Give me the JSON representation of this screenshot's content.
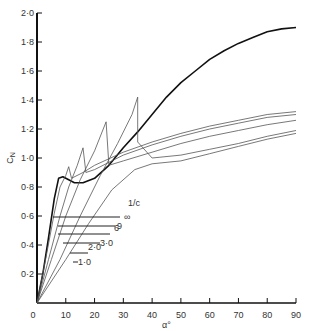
{
  "chart_data": {
    "type": "line",
    "title": "",
    "xlabel": "α°",
    "ylabel": "C_N",
    "xlim": [
      0,
      90
    ],
    "ylim": [
      0,
      2.0
    ],
    "grid": false,
    "x_ticks": [
      0,
      10,
      20,
      30,
      40,
      50,
      60,
      70,
      80,
      90
    ],
    "x_tick_labels": [
      "0",
      "10",
      "20",
      "30",
      "40",
      "50",
      "60",
      "70",
      "80",
      "90"
    ],
    "y_ticks": [
      0.2,
      0.4,
      0.6,
      0.8,
      1.0,
      1.2,
      1.4,
      1.6,
      1.8,
      2.0
    ],
    "y_tick_labels": [
      "0·2",
      "0·4",
      "0·6",
      "0·8",
      "1·0",
      "1·2",
      "1·4",
      "1·6",
      "1·8",
      "2·0"
    ],
    "legend": {
      "title": "1/c",
      "position": "inside-left-middle",
      "entries": [
        "∞",
        "9",
        "6",
        "3·0",
        "2·0",
        "1·0"
      ]
    },
    "series": [
      {
        "name": "∞",
        "bold": true,
        "points": [
          [
            0,
            0
          ],
          [
            2,
            0.2
          ],
          [
            4,
            0.45
          ],
          [
            6,
            0.72
          ],
          [
            7.5,
            0.86
          ],
          [
            9,
            0.87
          ],
          [
            11,
            0.85
          ],
          [
            13,
            0.83
          ],
          [
            16,
            0.83
          ],
          [
            20,
            0.86
          ],
          [
            25,
            0.95
          ],
          [
            30,
            1.07
          ],
          [
            35,
            1.18
          ],
          [
            40,
            1.3
          ],
          [
            45,
            1.42
          ],
          [
            50,
            1.52
          ],
          [
            55,
            1.6
          ],
          [
            60,
            1.68
          ],
          [
            65,
            1.74
          ],
          [
            70,
            1.79
          ],
          [
            75,
            1.83
          ],
          [
            80,
            1.87
          ],
          [
            85,
            1.89
          ],
          [
            90,
            1.9
          ]
        ]
      },
      {
        "name": "9",
        "bold": false,
        "points": [
          [
            0,
            0
          ],
          [
            3,
            0.3
          ],
          [
            6,
            0.62
          ],
          [
            8,
            0.8
          ],
          [
            10,
            0.88
          ],
          [
            11,
            0.94
          ],
          [
            12,
            0.86
          ],
          [
            16,
            0.9
          ],
          [
            20,
            0.95
          ],
          [
            30,
            1.04
          ],
          [
            40,
            1.11
          ],
          [
            50,
            1.17
          ],
          [
            60,
            1.22
          ],
          [
            70,
            1.26
          ],
          [
            80,
            1.3
          ],
          [
            90,
            1.32
          ]
        ]
      },
      {
        "name": "6",
        "bold": false,
        "points": [
          [
            0,
            0
          ],
          [
            4,
            0.3
          ],
          [
            8,
            0.6
          ],
          [
            11,
            0.8
          ],
          [
            14,
            0.95
          ],
          [
            16,
            1.07
          ],
          [
            17,
            0.9
          ],
          [
            20,
            0.92
          ],
          [
            30,
            1.02
          ],
          [
            40,
            1.09
          ],
          [
            50,
            1.15
          ],
          [
            60,
            1.2
          ],
          [
            70,
            1.24
          ],
          [
            80,
            1.28
          ],
          [
            90,
            1.3
          ]
        ]
      },
      {
        "name": "3·0",
        "bold": false,
        "points": [
          [
            0,
            0
          ],
          [
            5,
            0.3
          ],
          [
            10,
            0.6
          ],
          [
            15,
            0.85
          ],
          [
            20,
            1.05
          ],
          [
            24,
            1.25
          ],
          [
            25,
            0.95
          ],
          [
            30,
            0.98
          ],
          [
            40,
            1.04
          ],
          [
            50,
            1.1
          ],
          [
            60,
            1.15
          ],
          [
            70,
            1.19
          ],
          [
            80,
            1.23
          ],
          [
            90,
            1.26
          ]
        ]
      },
      {
        "name": "2·0",
        "bold": false,
        "points": [
          [
            0,
            0
          ],
          [
            8,
            0.3
          ],
          [
            15,
            0.6
          ],
          [
            22,
            0.88
          ],
          [
            28,
            1.1
          ],
          [
            33,
            1.3
          ],
          [
            35,
            1.42
          ],
          [
            35,
            1.11
          ],
          [
            40,
            1.0
          ],
          [
            50,
            1.02
          ],
          [
            60,
            1.06
          ],
          [
            70,
            1.1
          ],
          [
            80,
            1.15
          ],
          [
            90,
            1.19
          ]
        ]
      },
      {
        "name": "1·0",
        "bold": false,
        "points": [
          [
            0,
            0
          ],
          [
            10,
            0.3
          ],
          [
            18,
            0.55
          ],
          [
            26,
            0.78
          ],
          [
            34,
            0.92
          ],
          [
            40,
            0.96
          ],
          [
            50,
            0.98
          ],
          [
            60,
            1.03
          ],
          [
            70,
            1.08
          ],
          [
            80,
            1.13
          ],
          [
            90,
            1.17
          ]
        ]
      }
    ]
  }
}
